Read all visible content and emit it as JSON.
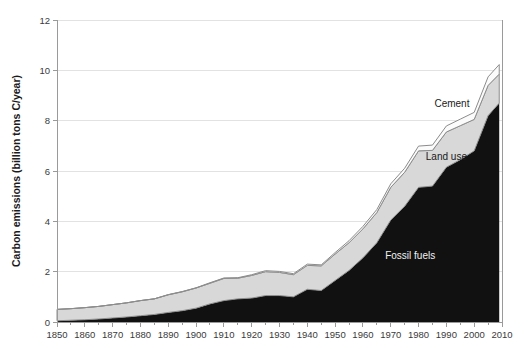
{
  "chart_data": {
    "type": "area",
    "stacked": true,
    "title": "",
    "xlabel": "",
    "ylabel": "Carbon emissions (billion tons C/year)",
    "xlim": [
      1850,
      2010
    ],
    "ylim": [
      0,
      12
    ],
    "ytick_step": 2,
    "yticks": [
      "0",
      "2",
      "4",
      "6",
      "8",
      "10",
      "12"
    ],
    "xticks": [
      "1850",
      "1860",
      "1870",
      "1880",
      "1890",
      "1900",
      "1910",
      "1920",
      "1930",
      "1940",
      "1950",
      "1960",
      "1970",
      "1980",
      "1990",
      "2000",
      "2010"
    ],
    "xtick_minor_step": 5,
    "grid": "horizontal",
    "legend_position": "inline-annotations",
    "annotations": [
      {
        "text": "Cement",
        "x": 1992,
        "y": 8.55
      },
      {
        "text": "Land use",
        "x": 1990,
        "y": 6.45
      },
      {
        "text": "Fossil fuels",
        "x": 1977,
        "y": 2.5
      }
    ],
    "colors": {
      "fossil_fuels": "#111111",
      "land_use": "#d8d8d8",
      "cement": "#fbfbfb",
      "outline": "#8c8c8c",
      "gridline": "#e2e2e2",
      "axis": "#9a9a9a",
      "background": "#ffffff",
      "label_dark": "#1a1a1a",
      "label_light": "#f2f2f2"
    },
    "x": [
      1850,
      1855,
      1860,
      1865,
      1870,
      1875,
      1880,
      1885,
      1890,
      1895,
      1900,
      1905,
      1910,
      1915,
      1920,
      1925,
      1930,
      1935,
      1940,
      1945,
      1950,
      1955,
      1960,
      1965,
      1970,
      1975,
      1980,
      1985,
      1990,
      1995,
      2000,
      2005,
      2009
    ],
    "series": [
      {
        "name": "Fossil fuels",
        "values": [
          0.05,
          0.07,
          0.09,
          0.12,
          0.16,
          0.2,
          0.25,
          0.3,
          0.38,
          0.45,
          0.55,
          0.72,
          0.85,
          0.92,
          0.95,
          1.05,
          1.05,
          1.0,
          1.3,
          1.25,
          1.65,
          2.05,
          2.55,
          3.15,
          4.05,
          4.6,
          5.35,
          5.4,
          6.15,
          6.45,
          6.8,
          8.2,
          8.7
        ]
      },
      {
        "name": "Land use",
        "values": [
          0.45,
          0.46,
          0.48,
          0.5,
          0.53,
          0.56,
          0.6,
          0.62,
          0.7,
          0.75,
          0.8,
          0.82,
          0.88,
          0.82,
          0.9,
          0.95,
          0.92,
          0.88,
          0.95,
          0.98,
          1.05,
          1.1,
          1.15,
          1.2,
          1.3,
          1.35,
          1.45,
          1.42,
          1.4,
          1.35,
          1.25,
          1.2,
          1.15
        ]
      },
      {
        "name": "Cement",
        "values": [
          0.0,
          0.0,
          0.0,
          0.0,
          0.0,
          0.0,
          0.0,
          0.0,
          0.01,
          0.01,
          0.01,
          0.02,
          0.02,
          0.02,
          0.03,
          0.04,
          0.04,
          0.04,
          0.05,
          0.04,
          0.06,
          0.08,
          0.1,
          0.12,
          0.14,
          0.16,
          0.19,
          0.21,
          0.24,
          0.26,
          0.28,
          0.34,
          0.38
        ]
      }
    ],
    "totals_note": ""
  },
  "plot_geometry": {
    "left": 57,
    "right": 502,
    "top": 20,
    "bottom": 322
  }
}
